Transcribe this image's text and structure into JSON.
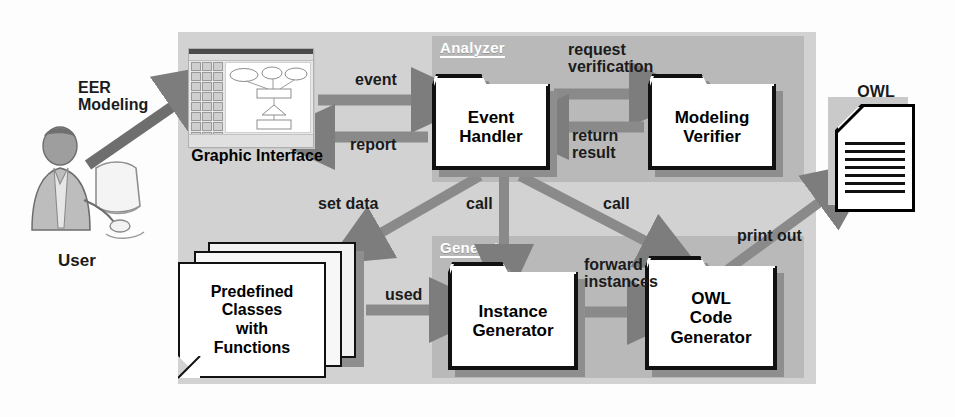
{
  "diagram": {
    "colors": {
      "outer_panel": "#d2d2d2",
      "sub_panel": "#b9b9b9",
      "box_fill": "#ffffff",
      "box_border": "#111111",
      "arrow": "#7d7d7d",
      "text": "#1b1b1b",
      "panel_title_text": "#ffffff"
    }
  },
  "actor": {
    "label": "User",
    "icon": "person-at-computer-icon"
  },
  "panels": [
    {
      "id": "analyzer",
      "title": "Analyzer"
    },
    {
      "id": "generator",
      "title": "Generator"
    }
  ],
  "components": {
    "graphic_interface": {
      "label": "Graphic Interface",
      "icon": "application-window-icon",
      "window": {
        "palette_buttons": 24,
        "diagram_shapes": [
          "ellipse",
          "ellipse",
          "ellipse",
          "rectangle",
          "triangle",
          "rectangle"
        ]
      }
    },
    "event_handler": {
      "lines": [
        "Event",
        "Handler"
      ]
    },
    "modeling_verifier": {
      "lines": [
        "Modeling",
        "Verifier"
      ]
    },
    "instance_generator": {
      "lines": [
        "Instance",
        "Generator"
      ]
    },
    "owl_code_generator": {
      "lines": [
        "OWL",
        "Code",
        "Generator"
      ]
    },
    "predefined_classes": {
      "lines": [
        "Predefined",
        "Classes",
        "with",
        "Functions"
      ],
      "icon": "stacked-documents-icon",
      "sheet_count": 3
    },
    "owl_code_document": {
      "title_lines": [
        "OWL",
        "Code"
      ],
      "icon": "document-icon",
      "text_line_count": 7
    }
  },
  "edges": [
    {
      "id": "eer-modeling",
      "lines": [
        "EER",
        "Modeling"
      ],
      "from": "user",
      "to": "graphic_interface"
    },
    {
      "id": "event",
      "lines": [
        "event"
      ],
      "from": "graphic_interface",
      "to": "event_handler"
    },
    {
      "id": "report",
      "lines": [
        "report"
      ],
      "from": "event_handler",
      "to": "graphic_interface"
    },
    {
      "id": "request-verification",
      "lines": [
        "request",
        "verification"
      ],
      "from": "event_handler",
      "to": "modeling_verifier"
    },
    {
      "id": "return-result",
      "lines": [
        "return",
        "result"
      ],
      "from": "modeling_verifier",
      "to": "event_handler"
    },
    {
      "id": "set-data",
      "lines": [
        "set data"
      ],
      "from": "event_handler",
      "to": "predefined_classes"
    },
    {
      "id": "call-instance",
      "lines": [
        "call"
      ],
      "from": "event_handler",
      "to": "instance_generator"
    },
    {
      "id": "call-owl",
      "lines": [
        "call"
      ],
      "from": "event_handler",
      "to": "owl_code_generator"
    },
    {
      "id": "used",
      "lines": [
        "used"
      ],
      "from": "predefined_classes",
      "to": "instance_generator"
    },
    {
      "id": "forward-instances",
      "lines": [
        "forward",
        "instances"
      ],
      "from": "instance_generator",
      "to": "owl_code_generator"
    },
    {
      "id": "print-out",
      "lines": [
        "print out"
      ],
      "from": "owl_code_generator",
      "to": "owl_code_document"
    }
  ]
}
